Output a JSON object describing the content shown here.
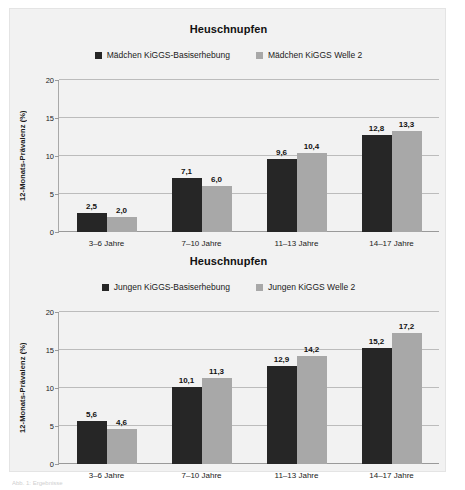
{
  "figure": {
    "caption": "Abb. 1: Ergebnisse",
    "panel_bg": "#f2f2f2"
  },
  "colors": {
    "series_1": "#262626",
    "series_2": "#a8a8a8",
    "gridline": "#bcbcbc",
    "axis": "#9a9a9a",
    "text": "#1b1b1b"
  },
  "chart_data": [
    {
      "type": "bar",
      "title": "Heuschnupfen",
      "xlabel": "",
      "ylabel": "12-Monats-Prävalenz (%)",
      "ylim": [
        0,
        20
      ],
      "yticks": [
        "0",
        "5",
        "10",
        "15",
        "20"
      ],
      "ytick_values": [
        0,
        5,
        10,
        15,
        20
      ],
      "grid": true,
      "legend_position": "top-center",
      "categories": [
        "3–6 Jahre",
        "7–10 Jahre",
        "11–13 Jahre",
        "14–17 Jahre"
      ],
      "series": [
        {
          "name": "Mädchen KiGGS-Basiserhebung",
          "color": "#262626",
          "values": [
            2.5,
            7.1,
            9.6,
            12.8
          ],
          "labels": [
            "2,5",
            "7,1",
            "9,6",
            "12,8"
          ]
        },
        {
          "name": "Mädchen KiGGS Welle 2",
          "color": "#a8a8a8",
          "values": [
            2.0,
            6.0,
            10.4,
            13.3
          ],
          "labels": [
            "2,0",
            "6,0",
            "10,4",
            "13,3"
          ]
        }
      ]
    },
    {
      "type": "bar",
      "title": "Heuschnupfen",
      "xlabel": "",
      "ylabel": "12-Monats-Prävalenz (%)",
      "ylim": [
        0,
        20
      ],
      "yticks": [
        "0",
        "5",
        "10",
        "15",
        "20"
      ],
      "ytick_values": [
        0,
        5,
        10,
        15,
        20
      ],
      "grid": true,
      "legend_position": "top-center",
      "categories": [
        "3–6 Jahre",
        "7–10 Jahre",
        "11–13 Jahre",
        "14–17 Jahre"
      ],
      "series": [
        {
          "name": "Jungen KiGGS-Basiserhebung",
          "color": "#262626",
          "values": [
            5.6,
            10.1,
            12.9,
            15.2
          ],
          "labels": [
            "5,6",
            "10,1",
            "12,9",
            "15,2"
          ]
        },
        {
          "name": "Jungen KiGGS Welle 2",
          "color": "#a8a8a8",
          "values": [
            4.6,
            11.3,
            14.2,
            17.2
          ],
          "labels": [
            "4,6",
            "11,3",
            "14,2",
            "17,2"
          ]
        }
      ]
    }
  ]
}
